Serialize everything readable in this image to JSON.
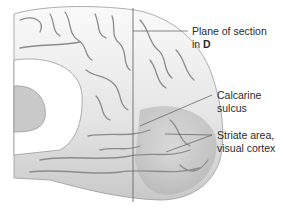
{
  "figure": {
    "labels": [
      {
        "id": "plane",
        "line1": "Plane of section",
        "line2_prefix": "in ",
        "line2_bold": "D"
      },
      {
        "id": "calcarine",
        "line1": "Calcarine",
        "line2": "sulcus"
      },
      {
        "id": "striate",
        "line1": "Striate area,",
        "line2": "visual cortex"
      }
    ],
    "colors": {
      "line": "#6a6a6a",
      "text": "#2a2a2a",
      "brain_light": "#f2f2f2",
      "brain_mid": "#cfcfcf",
      "brain_dark": "#8a8a8a"
    }
  }
}
